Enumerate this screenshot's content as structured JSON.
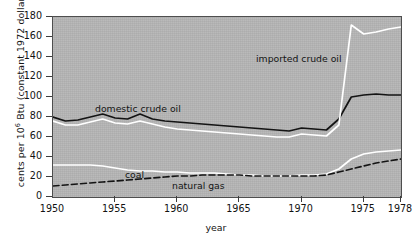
{
  "axes": {
    "ylabel_pre": "cents per 10",
    "ylabel_sup": "6",
    "ylabel_post": " Btu (constant 1972 dollars)",
    "xlabel": "year",
    "yticks": [
      0,
      20,
      40,
      60,
      80,
      100,
      120,
      140,
      160,
      180
    ],
    "xticks": [
      1950,
      1955,
      1960,
      1965,
      1970,
      1975,
      1978
    ]
  },
  "annotations": {
    "domestic": "domestic crude oil",
    "imported": "imported crude oil",
    "coal": "coal",
    "natural_gas": "natural gas"
  },
  "colors": {
    "plot_background": "#b5b5b5",
    "frame": "#4e4e4e",
    "domestic_crude_oil": "#141414",
    "imported_crude_oil": "#ffffff",
    "coal": "#ffffff",
    "natural_gas": "#141414",
    "text": "#121212"
  },
  "chart_data": {
    "type": "line",
    "title": "",
    "xlabel": "year",
    "ylabel": "cents per 10^6 Btu (constant 1972 dollars)",
    "xlim": [
      1950,
      1978
    ],
    "ylim": [
      0,
      180
    ],
    "grid": false,
    "legend": "inline annotations",
    "x": [
      1950,
      1951,
      1952,
      1953,
      1954,
      1955,
      1956,
      1957,
      1958,
      1959,
      1960,
      1961,
      1962,
      1963,
      1964,
      1965,
      1966,
      1967,
      1968,
      1969,
      1970,
      1971,
      1972,
      1973,
      1974,
      1975,
      1976,
      1977,
      1978
    ],
    "series": [
      {
        "name": "domestic crude oil",
        "style": "solid",
        "color": "#141414",
        "values": [
          80,
          76,
          77,
          80,
          83,
          79,
          78,
          83,
          78,
          76,
          75,
          74,
          73,
          72,
          71,
          70,
          69,
          68,
          67,
          66,
          69,
          68,
          67,
          78,
          100,
          102,
          103,
          102,
          102
        ]
      },
      {
        "name": "imported crude oil",
        "style": "solid",
        "color": "#ffffff",
        "values": [
          76,
          72,
          72,
          75,
          78,
          74,
          73,
          76,
          73,
          70,
          68,
          67,
          66,
          65,
          64,
          63,
          62,
          61,
          60,
          60,
          63,
          62,
          61,
          72,
          172,
          163,
          165,
          168,
          170
        ]
      },
      {
        "name": "coal",
        "style": "solid",
        "color": "#ffffff",
        "values": [
          32,
          32,
          32,
          32,
          31,
          29,
          27,
          26,
          26,
          25,
          25,
          24,
          24,
          24,
          23,
          22,
          22,
          21,
          21,
          21,
          22,
          22,
          23,
          28,
          38,
          43,
          45,
          46,
          47
        ]
      },
      {
        "name": "natural gas",
        "style": "dashed",
        "color": "#141414",
        "values": [
          11,
          12,
          13,
          14,
          15,
          16,
          17,
          18,
          19,
          20,
          21,
          21,
          22,
          22,
          22,
          22,
          21,
          21,
          21,
          21,
          21,
          21,
          22,
          25,
          28,
          31,
          34,
          36,
          38
        ]
      }
    ]
  }
}
